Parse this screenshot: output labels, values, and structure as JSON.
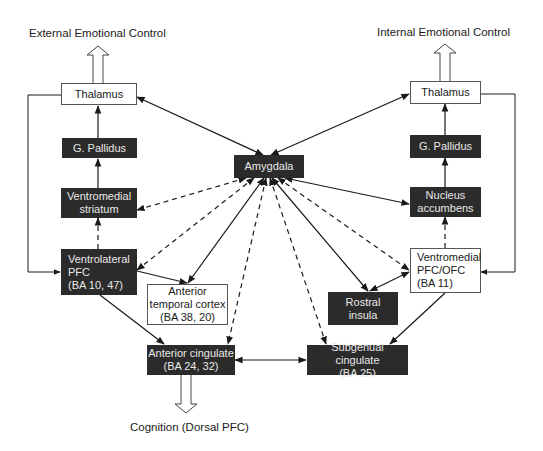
{
  "diagram": {
    "outputs": {
      "external": "External Emotional Control",
      "internal": "Internal Emotional Control",
      "cognition": "Cognition (Dorsal PFC)"
    },
    "nodes": {
      "thalamus_left": "Thalamus",
      "pallidus_left": "G. Pallidus",
      "vm_striatum": "Ventromedial\nstriatum",
      "vl_pfc": "Ventrolateral\nPFC\n(BA 10, 47)",
      "ant_temporal": "Anterior\ntemporal cortex\n(BA 38, 20)",
      "amygdala": "Amygdala",
      "thalamus_right": "Thalamus",
      "pallidus_right": "G. Pallidus",
      "n_accumbens": "Nucleus\naccumbens",
      "vm_pfc_ofc": "Ventromedial\nPFC/OFC\n(BA 11)",
      "rostral_insula": "Rostral\ninsula",
      "ant_cingulate": "Anterior cingulate\n(BA 24, 32)",
      "subgenual_cingulate": "Subgenual cingulate\n(BA 25)"
    },
    "colors": {
      "dark_fill": "#2b2b2b",
      "dark_text": "#e8e8e8",
      "line": "#1a1a1a"
    },
    "edges": [
      {
        "from": "amygdala",
        "to": "thalamus_left",
        "style": "solid",
        "arrows": "both"
      },
      {
        "from": "amygdala",
        "to": "thalamus_right",
        "style": "solid",
        "arrows": "both"
      },
      {
        "from": "pallidus_left",
        "to": "thalamus_left",
        "style": "solid",
        "arrows": "end"
      },
      {
        "from": "vm_striatum",
        "to": "pallidus_left",
        "style": "solid",
        "arrows": "end"
      },
      {
        "from": "vl_pfc",
        "to": "vm_striatum",
        "style": "dashed",
        "arrows": "end"
      },
      {
        "from": "thalamus_left",
        "to": "vl_pfc",
        "style": "solid-elbow",
        "arrows": "end"
      },
      {
        "from": "pallidus_right",
        "to": "thalamus_right",
        "style": "solid",
        "arrows": "end"
      },
      {
        "from": "n_accumbens",
        "to": "pallidus_right",
        "style": "solid",
        "arrows": "end"
      },
      {
        "from": "vm_pfc_ofc",
        "to": "n_accumbens",
        "style": "dashed",
        "arrows": "end"
      },
      {
        "from": "thalamus_right",
        "to": "vm_pfc_ofc",
        "style": "solid-elbow",
        "arrows": "end"
      },
      {
        "from": "amygdala",
        "to": "vm_striatum",
        "style": "dashed",
        "arrows": "both"
      },
      {
        "from": "amygdala",
        "to": "vl_pfc",
        "style": "dashed",
        "arrows": "both"
      },
      {
        "from": "amygdala",
        "to": "ant_temporal",
        "style": "solid",
        "arrows": "both"
      },
      {
        "from": "amygdala",
        "to": "ant_cingulate",
        "style": "dashed",
        "arrows": "both"
      },
      {
        "from": "amygdala",
        "to": "subgenual_cingulate",
        "style": "dashed",
        "arrows": "both"
      },
      {
        "from": "amygdala",
        "to": "rostral_insula",
        "style": "solid",
        "arrows": "both"
      },
      {
        "from": "amygdala",
        "to": "vm_pfc_ofc",
        "style": "dashed",
        "arrows": "both"
      },
      {
        "from": "amygdala",
        "to": "n_accumbens",
        "style": "solid",
        "arrows": "both"
      },
      {
        "from": "vl_pfc",
        "to": "ant_temporal",
        "style": "solid",
        "arrows": "end"
      },
      {
        "from": "vl_pfc",
        "to": "ant_cingulate",
        "style": "solid",
        "arrows": "end"
      },
      {
        "from": "vm_pfc_ofc",
        "to": "rostral_insula",
        "style": "solid",
        "arrows": "both"
      },
      {
        "from": "vm_pfc_ofc",
        "to": "subgenual_cingulate",
        "style": "solid",
        "arrows": "end"
      },
      {
        "from": "ant_cingulate",
        "to": "subgenual_cingulate",
        "style": "solid",
        "arrows": "both"
      }
    ]
  }
}
